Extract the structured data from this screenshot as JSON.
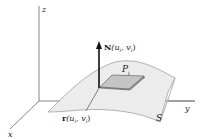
{
  "figure": {
    "axes": {
      "x_label": "x",
      "y_label": "y",
      "z_label": "z"
    },
    "labels": {
      "normal_vector": "N",
      "normal_args": "(u_i, v_i)",
      "normal_full": "N(u_i, v_i)",
      "patch": "P",
      "patch_sub": "i",
      "point": "r",
      "point_full": "r(u_i, v_i)",
      "surface": "S"
    },
    "colors": {
      "axis": "#777777",
      "surface_fill": "#ececec",
      "surface_edge": "#a0a0a0",
      "patch_fill": "#b8b8b8",
      "patch_edge": "#555555",
      "arrow": "#111111",
      "text": "#222222"
    }
  }
}
